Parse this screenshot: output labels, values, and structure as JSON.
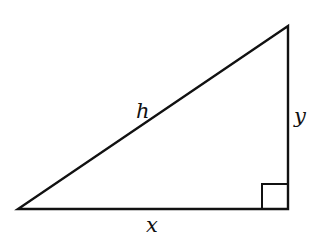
{
  "diagram": {
    "type": "right-triangle",
    "colors": {
      "stroke": "#111111",
      "background": "#ffffff"
    },
    "vertices": {
      "bottom_left": [
        18,
        209
      ],
      "bottom_right": [
        288,
        209
      ],
      "top_right": [
        288,
        26
      ]
    },
    "right_angle_marker": {
      "x": 262,
      "y": 184,
      "size": 26,
      "corner": "bottom-right"
    },
    "labels": {
      "hypotenuse": {
        "text": "h",
        "x": 136,
        "y": 118
      },
      "vertical_leg": {
        "text": "y",
        "x": 294,
        "y": 123
      },
      "horizontal_leg": {
        "text": "x",
        "x": 146,
        "y": 232
      }
    }
  }
}
